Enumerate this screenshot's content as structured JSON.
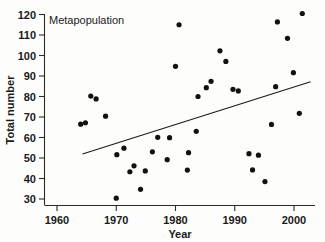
{
  "chart_data": {
    "type": "scatter",
    "title": "Metapopulation",
    "xlabel": "Year",
    "ylabel": "Total number",
    "xlim": [
      1959,
      2003
    ],
    "ylim": [
      28,
      123
    ],
    "xticks": [
      1960,
      1970,
      1980,
      1990,
      2000
    ],
    "yticks": [
      30,
      40,
      50,
      60,
      70,
      80,
      90,
      100,
      110,
      120
    ],
    "grid": false,
    "legend": null,
    "series": [
      {
        "name": "Total number",
        "marker": "filled-circle",
        "color": "#111111",
        "points": [
          [
            1964,
            66.5
          ],
          [
            1964.8,
            67.2
          ],
          [
            1965.7,
            80.2
          ],
          [
            1966.6,
            78.8
          ],
          [
            1968.2,
            70.4
          ],
          [
            1970.0,
            30.4
          ],
          [
            1970.1,
            51.6
          ],
          [
            1971.3,
            54.8
          ],
          [
            1972.3,
            43.3
          ],
          [
            1973.0,
            46.2
          ],
          [
            1974.1,
            34.7
          ],
          [
            1974.9,
            43.7
          ],
          [
            1976.1,
            53.0
          ],
          [
            1977.0,
            60.1
          ],
          [
            1978.6,
            49.2
          ],
          [
            1979.0,
            59.9
          ],
          [
            1980.0,
            94.7
          ],
          [
            1980.6,
            115.0
          ],
          [
            1982.0,
            44.1
          ],
          [
            1982.2,
            52.6
          ],
          [
            1983.5,
            63.0
          ],
          [
            1983.8,
            80.0
          ],
          [
            1985.2,
            84.3
          ],
          [
            1986.0,
            87.4
          ],
          [
            1987.5,
            102.3
          ],
          [
            1988.5,
            97.1
          ],
          [
            1989.7,
            83.5
          ],
          [
            1990.6,
            82.7
          ],
          [
            1992.4,
            52.1
          ],
          [
            1993.0,
            44.2
          ],
          [
            1994.0,
            51.4
          ],
          [
            1995.1,
            38.5
          ],
          [
            1996.2,
            66.4
          ],
          [
            1996.9,
            84.8
          ],
          [
            1997.2,
            116.4
          ],
          [
            1998.9,
            108.4
          ],
          [
            1999.9,
            91.6
          ],
          [
            2000.9,
            71.8
          ],
          [
            2001.4,
            120.5
          ]
        ]
      }
    ],
    "trend_line": {
      "name": "regression-line",
      "x0": 1964.3,
      "y0": 52.0,
      "x1": 2002.8,
      "y1": 87.2
    }
  }
}
